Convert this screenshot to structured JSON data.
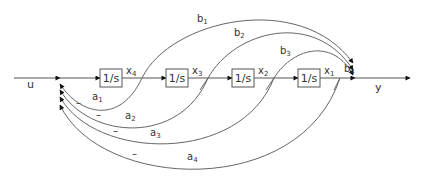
{
  "diagram": {
    "type": "signal-flow-block-diagram",
    "input_label": "u",
    "output_label": "y",
    "blocks": [
      {
        "label": "1/s",
        "output": "x",
        "sub": "4"
      },
      {
        "label": "1/s",
        "output": "x",
        "sub": "3"
      },
      {
        "label": "1/s",
        "output": "x",
        "sub": "2"
      },
      {
        "label": "1/s",
        "output": "x",
        "sub": "1"
      }
    ],
    "feedforward_gains": [
      {
        "label": "b",
        "sub": "1"
      },
      {
        "label": "b",
        "sub": "2"
      },
      {
        "label": "b",
        "sub": "3"
      },
      {
        "label": "b",
        "sub": "4"
      }
    ],
    "feedback_gains": [
      {
        "label": "a",
        "sub": "1",
        "sign": "–"
      },
      {
        "label": "a",
        "sub": "2",
        "sign": "–"
      },
      {
        "label": "a",
        "sub": "3",
        "sign": "–"
      },
      {
        "label": "a",
        "sub": "4",
        "sign": "–"
      }
    ],
    "colors": {
      "line": "#555555",
      "arrow": "#111111",
      "text": "#333333"
    }
  }
}
